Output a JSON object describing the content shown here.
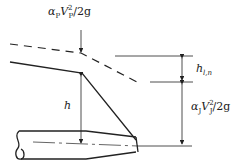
{
  "labels": {
    "approach_head": {
      "coef": "α",
      "coef_sub": "P",
      "vel": "V",
      "vel_sub": "P",
      "exp": "2",
      "tail": "/2g"
    },
    "head_loss": {
      "sym": "h",
      "sub": "l,n"
    },
    "jet_head": {
      "coef": "α",
      "coef_sub": "J",
      "vel": "V",
      "vel_sub": "J",
      "exp": "2",
      "tail": "/2g"
    },
    "head": {
      "sym": "h"
    }
  },
  "colors": {
    "stroke": "#222222",
    "background": "#ffffff"
  }
}
